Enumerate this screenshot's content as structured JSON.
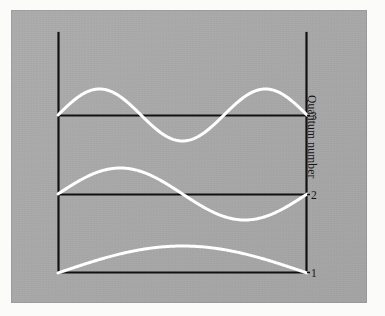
{
  "figure": {
    "kind": "physics-diagram",
    "background_color": "#a9a9a9",
    "paper_color": "#fbfbfa",
    "axis_color": "#111111",
    "wave_color": "#ffffff"
  },
  "axes": {
    "y_axis_label": "Quantum number",
    "tick_labels": [
      "3",
      "2",
      "1"
    ]
  },
  "chart_data": {
    "type": "line",
    "title": "",
    "xlabel": "",
    "ylabel": "Quantum number",
    "grid": false,
    "legend": null,
    "xlim": [
      0,
      1
    ],
    "ylim": [
      0,
      3
    ],
    "y_ticks": [
      1,
      2,
      3
    ],
    "y_tick_labels": [
      "1",
      "2",
      "3"
    ],
    "box": {
      "left_px": 58,
      "right_px": 307,
      "top_px": 33,
      "bottom_px": 273
    },
    "levels": [
      {
        "name": "n = 3",
        "quantum_number": 3,
        "baseline_px": 115,
        "amplitude_px": 26,
        "half_waves": 3,
        "nodes_interior": 2,
        "function": "sin(3*pi*x/L)"
      },
      {
        "name": "n = 2",
        "quantum_number": 2,
        "baseline_px": 194,
        "amplitude_px": 26,
        "half_waves": 2,
        "nodes_interior": 1,
        "function": "sin(2*pi*x/L)"
      },
      {
        "name": "n = 1",
        "quantum_number": 1,
        "baseline_px": 273,
        "amplitude_px": 27,
        "half_waves": 1,
        "nodes_interior": 0,
        "function": "sin(pi*x/L)"
      }
    ],
    "series": [
      {
        "name": "n = 1",
        "x": [
          0,
          0.05,
          0.1,
          0.15,
          0.2,
          0.25,
          0.3,
          0.35,
          0.4,
          0.45,
          0.5,
          0.55,
          0.6,
          0.65,
          0.7,
          0.75,
          0.8,
          0.85,
          0.9,
          0.95,
          1
        ],
        "values": [
          0,
          0.156,
          0.309,
          0.454,
          0.588,
          0.707,
          0.809,
          0.891,
          0.951,
          0.988,
          1,
          0.988,
          0.951,
          0.891,
          0.809,
          0.707,
          0.588,
          0.454,
          0.309,
          0.156,
          0
        ]
      },
      {
        "name": "n = 2",
        "x": [
          0,
          0.05,
          0.1,
          0.15,
          0.2,
          0.25,
          0.3,
          0.35,
          0.4,
          0.45,
          0.5,
          0.55,
          0.6,
          0.65,
          0.7,
          0.75,
          0.8,
          0.85,
          0.9,
          0.95,
          1
        ],
        "values": [
          0,
          0.309,
          0.588,
          0.809,
          0.951,
          1,
          0.951,
          0.809,
          0.588,
          0.309,
          0,
          -0.309,
          -0.588,
          -0.809,
          -0.951,
          -1,
          -0.951,
          -0.809,
          -0.588,
          -0.309,
          0
        ]
      },
      {
        "name": "n = 3",
        "x": [
          0,
          0.05,
          0.1,
          0.15,
          0.2,
          0.25,
          0.3,
          0.35,
          0.4,
          0.45,
          0.5,
          0.55,
          0.6,
          0.65,
          0.7,
          0.75,
          0.8,
          0.85,
          0.9,
          0.95,
          1
        ],
        "values": [
          0,
          0.454,
          0.809,
          0.988,
          0.951,
          0.707,
          0.309,
          -0.156,
          -0.588,
          -0.891,
          -1,
          -0.891,
          -0.588,
          -0.156,
          0.309,
          0.707,
          0.951,
          0.988,
          0.809,
          0.454,
          0
        ]
      }
    ]
  }
}
